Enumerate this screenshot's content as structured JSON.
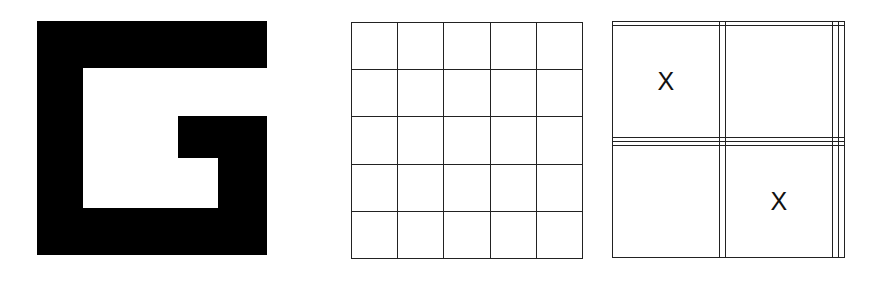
{
  "figure": {
    "shape_label": "G-shaped pattern",
    "shape_color": "#000000",
    "grids": [
      {
        "name": "empty-grid",
        "rows": 5,
        "cols": 5,
        "cells": [
          [
            "",
            "",
            "",
            "",
            ""
          ],
          [
            "",
            "",
            "",
            "",
            ""
          ],
          [
            "",
            "",
            "",
            "",
            ""
          ],
          [
            "",
            "",
            "",
            "",
            ""
          ],
          [
            "",
            "",
            "",
            "",
            ""
          ]
        ]
      },
      {
        "name": "marked-grid",
        "rows": 5,
        "cols": 5,
        "cells": [
          [
            "",
            "",
            "",
            "",
            ""
          ],
          [
            "X",
            "",
            "",
            "",
            ""
          ],
          [
            "",
            "",
            "",
            "",
            ""
          ],
          [
            "",
            "",
            "",
            "",
            ""
          ],
          [
            "",
            "",
            "X",
            "",
            ""
          ]
        ]
      }
    ]
  }
}
